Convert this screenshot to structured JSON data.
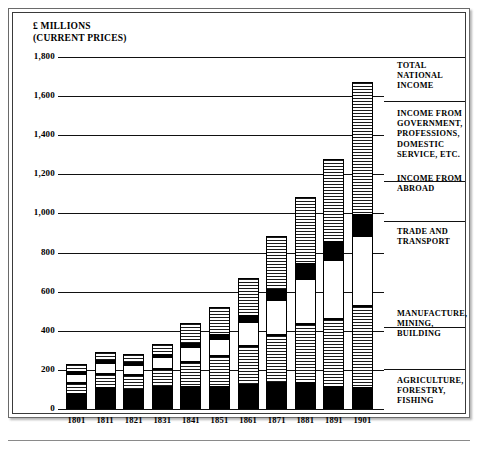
{
  "units_caption": "£ MILLIONS\n(CURRENT PRICES)",
  "chart_data": {
    "type": "bar",
    "subtype": "stacked",
    "title": "",
    "xlabel": "",
    "ylabel": "£ Millions (current prices)",
    "ylim": [
      0,
      1800
    ],
    "ytick_step": 200,
    "grid": true,
    "legend_position": "right",
    "categories": [
      "1801",
      "1811",
      "1821",
      "1831",
      "1841",
      "1851",
      "1861",
      "1871",
      "1881",
      "1891",
      "1901"
    ],
    "ytick_labels": [
      "0",
      "200",
      "400",
      "600",
      "800",
      "1,000",
      "1,200",
      "1,400",
      "1,600",
      "1,800"
    ],
    "series": [
      {
        "name": "AGRICULTURE,\nFORESTRY,\nFISHING",
        "short": "agriculture",
        "fill": "solid-black",
        "values": [
          75,
          105,
          95,
          110,
          115,
          110,
          125,
          135,
          135,
          110,
          105
        ]
      },
      {
        "name": "MANUFACTURE,\nMINING,\nBUILDING",
        "short": "manufacture",
        "fill": "horizontal-stripes",
        "values": [
          60,
          75,
          80,
          95,
          125,
          160,
          195,
          245,
          300,
          350,
          420
        ]
      },
      {
        "name": "TRADE AND\nTRANSPORT",
        "short": "trade",
        "fill": "blank-white",
        "values": [
          45,
          55,
          50,
          60,
          75,
          90,
          125,
          175,
          230,
          300,
          360
        ]
      },
      {
        "name": "INCOME FROM\nABROAD",
        "short": "abroad",
        "fill": "solid-black",
        "values": [
          10,
          10,
          10,
          10,
          15,
          20,
          30,
          55,
          75,
          95,
          105
        ]
      },
      {
        "name": "INCOME FROM\nGOVERNMENT,\nPROFESSIONS,\nDOMESTIC\nSERVICE, ETC.",
        "short": "government",
        "fill": "horizontal-stripes",
        "values": [
          40,
          45,
          45,
          55,
          110,
          140,
          195,
          275,
          345,
          425,
          680
        ]
      }
    ],
    "totals_label": "TOTAL NATIONAL\nINCOME",
    "totals": [
      230,
      290,
      280,
      330,
      440,
      520,
      670,
      885,
      1085,
      1280,
      1670
    ]
  },
  "legend": [
    {
      "label": "TOTAL NATIONAL\nINCOME"
    },
    {
      "label": "INCOME FROM\nGOVERNMENT,\nPROFESSIONS,\nDOMESTIC\nSERVICE, ETC."
    },
    {
      "label": "INCOME FROM\nABROAD"
    },
    {
      "label": "TRADE AND\nTRANSPORT"
    },
    {
      "label": "MANUFACTURE,\nMINING,\nBUILDING"
    },
    {
      "label": "AGRICULTURE,\nFORESTRY,\nFISHING"
    }
  ]
}
